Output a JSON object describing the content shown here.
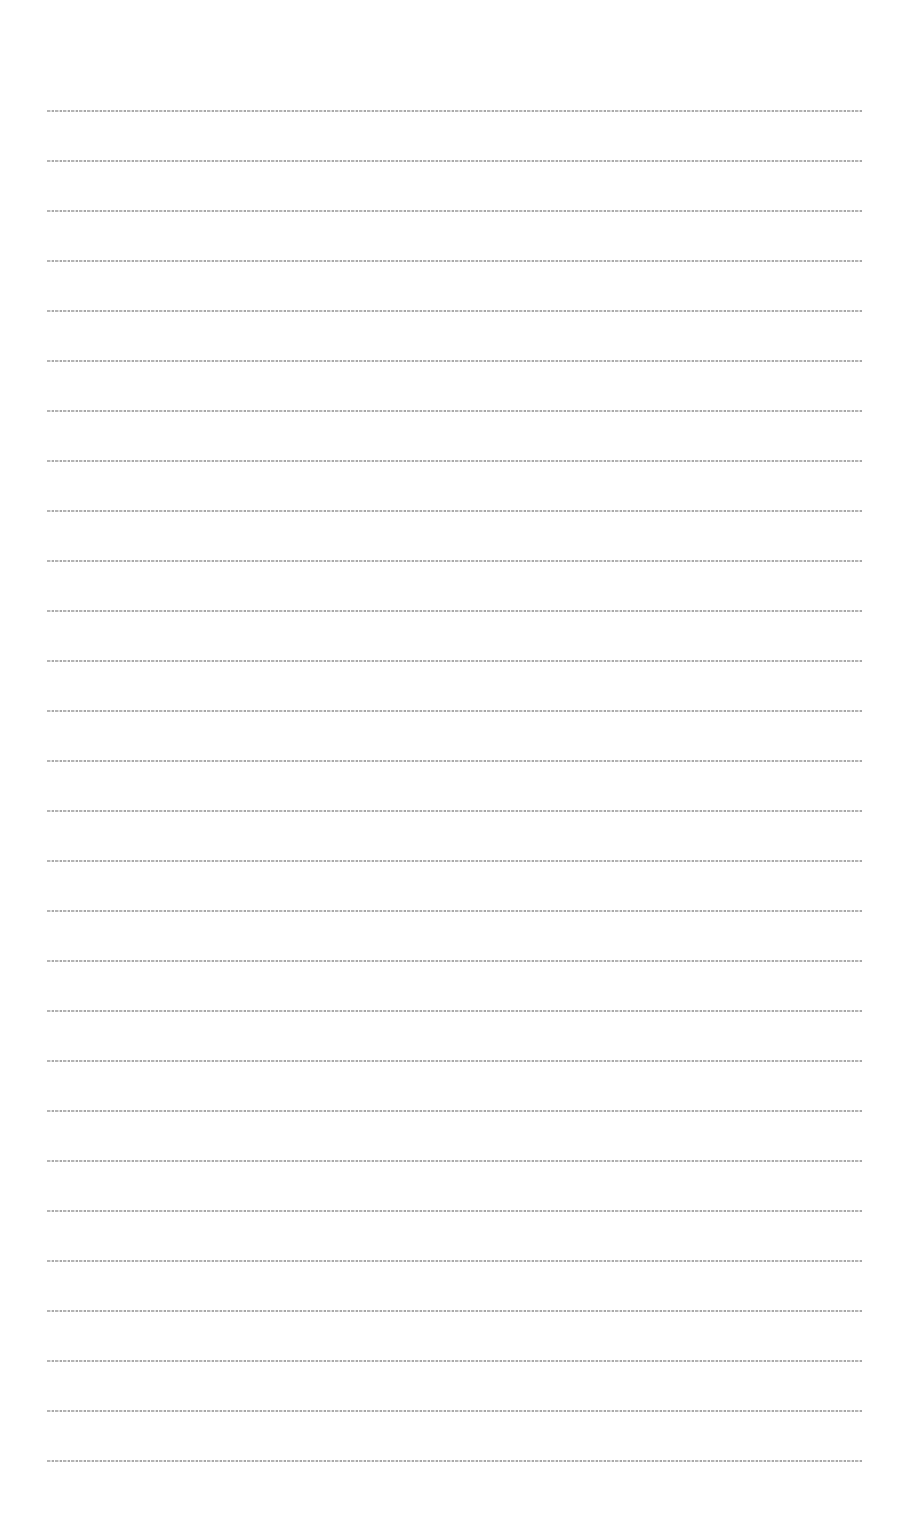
{
  "document": {
    "type": "text page (micro-scale, illegible)",
    "line_color": "#7a7a7a",
    "background": "#ffffff",
    "lines": [
      {
        "top": 109,
        "text": "[illegible text line 1]"
      },
      {
        "top": 159,
        "text": "[illegible text line 2]"
      },
      {
        "top": 209,
        "text": "[illegible text line 3]"
      },
      {
        "top": 259,
        "text": "[illegible text line 4]"
      },
      {
        "top": 309,
        "text": "[illegible text line 5]"
      },
      {
        "top": 359,
        "text": "[illegible text line 6]"
      },
      {
        "top": 409,
        "text": "[illegible text line 7]"
      },
      {
        "top": 459,
        "text": "[illegible text line 8]"
      },
      {
        "top": 509,
        "text": "[illegible text line 9]"
      },
      {
        "top": 559,
        "text": "[illegible text line 10]"
      },
      {
        "top": 609,
        "text": "[illegible text line 11]"
      },
      {
        "top": 659,
        "text": "[illegible text line 12]"
      },
      {
        "top": 709,
        "text": "[illegible text line 13]"
      },
      {
        "top": 759,
        "text": "[illegible text line 14]"
      },
      {
        "top": 809,
        "text": "[illegible text line 15]"
      },
      {
        "top": 859,
        "text": "[illegible text line 16]"
      },
      {
        "top": 909,
        "text": "[illegible text line 17]"
      },
      {
        "top": 959,
        "text": "[illegible text line 18]"
      },
      {
        "top": 1009,
        "text": "[illegible text line 19]"
      },
      {
        "top": 1059,
        "text": "[illegible text line 20]"
      },
      {
        "top": 1109,
        "text": "[illegible text line 21]"
      },
      {
        "top": 1159,
        "text": "[illegible text line 22]"
      },
      {
        "top": 1209,
        "text": "[illegible text line 23]"
      },
      {
        "top": 1259,
        "text": "[illegible text line 24]"
      },
      {
        "top": 1309,
        "text": "[illegible text line 25]"
      },
      {
        "top": 1359,
        "text": "[illegible text line 26]"
      },
      {
        "top": 1409,
        "text": "[illegible text line 27]"
      },
      {
        "top": 1459,
        "text": "[illegible text line 28]"
      }
    ]
  }
}
